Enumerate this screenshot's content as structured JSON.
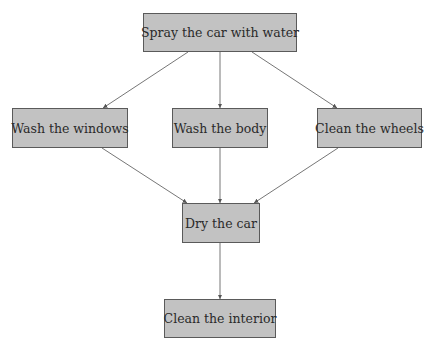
{
  "diagram": {
    "type": "flowchart",
    "colors": {
      "node_fill": "#c2c2c2",
      "node_border": "#5a5a5a",
      "edge": "#555555",
      "text": "#2a2a2a"
    },
    "nodes": [
      {
        "id": "spray",
        "label": "Spray the car with water",
        "x": 143,
        "y": 13,
        "w": 154,
        "h": 39
      },
      {
        "id": "windows",
        "label": "Wash the windows",
        "x": 12,
        "y": 108,
        "w": 116,
        "h": 40
      },
      {
        "id": "body",
        "label": "Wash the body",
        "x": 172,
        "y": 108,
        "w": 96,
        "h": 40
      },
      {
        "id": "wheels",
        "label": "Clean the wheels",
        "x": 317,
        "y": 108,
        "w": 105,
        "h": 40
      },
      {
        "id": "dry",
        "label": "Dry the car",
        "x": 182,
        "y": 203,
        "w": 78,
        "h": 40
      },
      {
        "id": "interior",
        "label": "Clean the interior",
        "x": 164,
        "y": 299,
        "w": 112,
        "h": 39
      }
    ],
    "edges": [
      {
        "from": "spray",
        "to": "windows"
      },
      {
        "from": "spray",
        "to": "body"
      },
      {
        "from": "spray",
        "to": "wheels"
      },
      {
        "from": "windows",
        "to": "dry"
      },
      {
        "from": "body",
        "to": "dry"
      },
      {
        "from": "wheels",
        "to": "dry"
      },
      {
        "from": "dry",
        "to": "interior"
      }
    ]
  }
}
